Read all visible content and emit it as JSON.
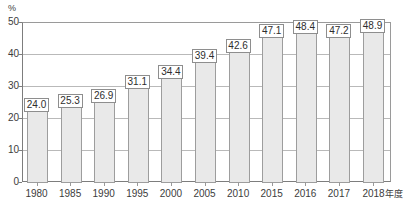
{
  "chart_data": {
    "type": "bar",
    "title": "",
    "subtitle": "",
    "xlabel": "",
    "ylabel": "",
    "unit_label": "%",
    "axis_suffix": "年度",
    "categories": [
      "1980",
      "1985",
      "1990",
      "1995",
      "2000",
      "2005",
      "2010",
      "2015",
      "2016",
      "2017",
      "2018"
    ],
    "values": [
      24.0,
      25.3,
      26.9,
      31.1,
      34.4,
      39.4,
      42.6,
      47.1,
      48.4,
      47.2,
      48.9
    ],
    "value_labels": [
      "24.0",
      "25.3",
      "26.9",
      "31.1",
      "34.4",
      "39.4",
      "42.6",
      "47.1",
      "48.4",
      "47.2",
      "48.9"
    ],
    "ylim": [
      0,
      50
    ],
    "yticks": [
      0,
      10,
      20,
      30,
      40,
      50
    ],
    "ytick_labels": [
      "0",
      "10",
      "20",
      "30",
      "40",
      "50"
    ],
    "grid": true,
    "legend": false,
    "legend_position": "none",
    "bar_fill": "#e9e9e9",
    "bar_border": "#9d9d9d",
    "grid_color": "#b9b9b9",
    "axis_color": "#7d7d7d",
    "text_color": "#3c3c3c"
  }
}
